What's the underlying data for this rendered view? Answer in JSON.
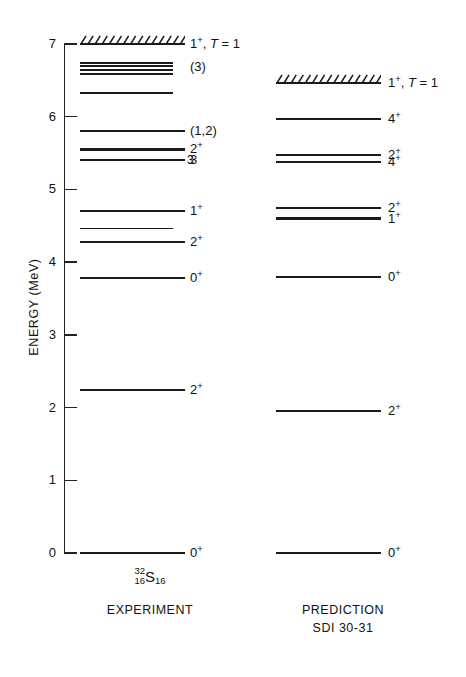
{
  "figure": {
    "axis": {
      "title": "ENERGY (MeV)",
      "ticks": [
        "7",
        "6",
        "5",
        "4",
        "3",
        "2",
        "1",
        "0"
      ],
      "min": 0,
      "max": 7
    },
    "columns": [
      {
        "id": "experiment",
        "caption": "EXPERIMENT",
        "nuclide": {
          "mass": "32",
          "proton": "16",
          "symbol": "S",
          "neutron": "16"
        }
      },
      {
        "id": "prediction",
        "caption_line1": "PREDICTION",
        "caption_line2": "SDI 30-31"
      }
    ]
  },
  "chart_data": {
    "type": "level-diagram",
    "title": "",
    "xlabel": "",
    "ylabel": "ENERGY (MeV)",
    "ylim": [
      0,
      7
    ],
    "grid": false,
    "legend": "none",
    "series": [
      {
        "name": "EXPERIMENT",
        "levels": [
          {
            "energy": 0.0,
            "label": "0+",
            "label_html": "0<sup>+</sup>",
            "style": "line"
          },
          {
            "energy": 2.24,
            "label": "2+",
            "label_html": "2<sup>+</sup>",
            "style": "line"
          },
          {
            "energy": 3.78,
            "label": "0+",
            "label_html": "0<sup>+</sup>",
            "style": "line"
          },
          {
            "energy": 4.28,
            "label": "2+",
            "label_html": "2<sup>+</sup>",
            "style": "line"
          },
          {
            "energy": 4.46,
            "label": "",
            "label_html": "",
            "style": "line-short"
          },
          {
            "energy": 4.7,
            "label": "1+",
            "label_html": "1<sup>+</sup>",
            "style": "line"
          },
          {
            "energy": 5.41,
            "label": "3",
            "label_html": "3",
            "style": "line",
            "inner_label": "3"
          },
          {
            "energy": 5.55,
            "label": "2+",
            "label_html": "2<sup>+</sup>",
            "style": "line"
          },
          {
            "energy": 5.8,
            "label": "(1,2)",
            "label_html": "(1,2)",
            "style": "line"
          },
          {
            "energy": 6.32,
            "label": "",
            "label_html": "",
            "style": "line-short"
          },
          {
            "energy": 6.58,
            "label": "",
            "label_html": "",
            "style": "line-short"
          },
          {
            "energy": 6.64,
            "label": "",
            "label_html": "",
            "style": "line-short"
          },
          {
            "energy": 6.69,
            "label": "(3)",
            "label_html": "(3)",
            "style": "line-short"
          },
          {
            "energy": 6.74,
            "label": "",
            "label_html": "",
            "style": "line-short"
          },
          {
            "energy": 7.0,
            "label": "1+, T = 1",
            "label_html": "1<sup>+</sup>, <span class=\"ital\">T</span> = 1",
            "style": "hatched"
          }
        ]
      },
      {
        "name": "PREDICTION SDI 30-31",
        "levels": [
          {
            "energy": 0.0,
            "label": "0+",
            "label_html": "0<sup>+</sup>",
            "style": "line"
          },
          {
            "energy": 1.95,
            "label": "2+",
            "label_html": "2<sup>+</sup>",
            "style": "line"
          },
          {
            "energy": 3.8,
            "label": "0+",
            "label_html": "0<sup>+</sup>",
            "style": "line"
          },
          {
            "energy": 4.6,
            "label": "1+",
            "label_html": "1<sup>+</sup>",
            "style": "line"
          },
          {
            "energy": 4.75,
            "label": "2+",
            "label_html": "2<sup>+</sup>",
            "style": "line"
          },
          {
            "energy": 5.38,
            "label": "4+",
            "label_html": "4<sup>+</sup>",
            "style": "line"
          },
          {
            "energy": 5.47,
            "label": "2+",
            "label_html": "2<sup>+</sup>",
            "style": "line"
          },
          {
            "energy": 5.97,
            "label": "4+",
            "label_html": "4<sup>+</sup>",
            "style": "line"
          },
          {
            "energy": 6.46,
            "label": "1+, T = 1",
            "label_html": "1<sup>+</sup>, <span class=\"ital\">T</span> = 1",
            "style": "hatched"
          }
        ]
      }
    ]
  }
}
